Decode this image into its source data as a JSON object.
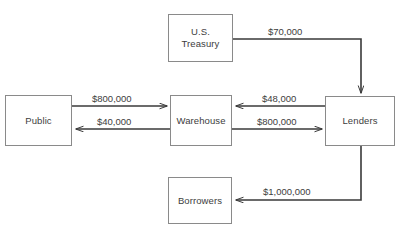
{
  "diagram": {
    "type": "flow-diagram",
    "title": "",
    "colors": {
      "node_border": "#8a8a8a",
      "node_fill": "#ffffff",
      "edge_stroke": "#3a3a3a",
      "text": "#3d3d3d",
      "background": "#ffffff"
    },
    "nodes": [
      {
        "id": "treasury",
        "label": "U.S.\nTreasury",
        "x": 168,
        "y": 14,
        "w": 65,
        "h": 48
      },
      {
        "id": "public",
        "label": "Public",
        "x": 5,
        "y": 95,
        "w": 67,
        "h": 51
      },
      {
        "id": "warehouse",
        "label": "Warehouse",
        "x": 170,
        "y": 95,
        "w": 62,
        "h": 51
      },
      {
        "id": "lenders",
        "label": "Lenders",
        "x": 325,
        "y": 96,
        "w": 70,
        "h": 50
      },
      {
        "id": "borrowers",
        "label": "Borrowers",
        "x": 168,
        "y": 177,
        "w": 64,
        "h": 47
      }
    ],
    "edges": [
      {
        "id": "treasury-to-lenders",
        "from": "treasury",
        "to": "lenders",
        "label": "$70,000",
        "label_x": 268,
        "label_y": 26
      },
      {
        "id": "public-to-warehouse",
        "from": "public",
        "to": "warehouse",
        "label": "$800,000",
        "label_x": 92,
        "label_y": 93
      },
      {
        "id": "warehouse-to-public",
        "from": "warehouse",
        "to": "public",
        "label": "$40,000",
        "label_x": 97,
        "label_y": 116
      },
      {
        "id": "lenders-to-warehouse",
        "from": "lenders",
        "to": "warehouse",
        "label": "$48,000",
        "label_x": 262,
        "label_y": 93
      },
      {
        "id": "warehouse-to-lenders",
        "from": "warehouse",
        "to": "lenders",
        "label": "$800,000",
        "label_x": 257,
        "label_y": 116
      },
      {
        "id": "lenders-to-borrowers",
        "from": "lenders",
        "to": "borrowers",
        "label": "$1,000,000",
        "label_x": 263,
        "label_y": 186
      }
    ]
  }
}
